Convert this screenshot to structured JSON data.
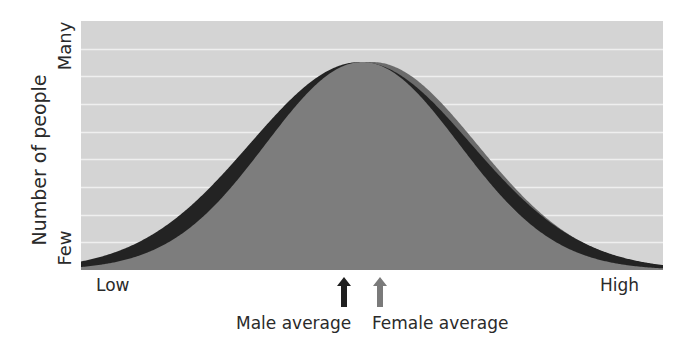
{
  "chart_data": {
    "type": "area",
    "title": "",
    "xlabel": "",
    "ylabel": "Number of people",
    "x_tick_labels": [
      "Low",
      "High"
    ],
    "y_tick_labels": [
      "Few",
      "Many"
    ],
    "grid": true,
    "gridlines_horizontal": 8,
    "legend": null,
    "series": [
      {
        "name": "Male",
        "shape": "normal distribution",
        "mean_relative": 0.48,
        "sd_relative": 0.19,
        "peak_relative": 1.0,
        "color": "#232323"
      },
      {
        "name": "Female",
        "shape": "normal distribution",
        "mean_relative": 0.5,
        "sd_relative": 0.18,
        "peak_relative": 1.0,
        "color_left_visible": "#7c7c7c",
        "color_right_tail": "#6a6a6a"
      }
    ],
    "annotations": [
      {
        "text": "Male average",
        "arrow": "up",
        "arrow_color": "#1e1e1e",
        "x_relative": 0.45
      },
      {
        "text": "Female average",
        "arrow": "up",
        "arrow_color": "#7a7a7a",
        "x_relative": 0.51
      }
    ]
  },
  "labels": {
    "y_axis_title": "Number of people",
    "y_top": "Many",
    "y_bottom": "Few",
    "x_left": "Low",
    "x_right": "High",
    "male_average": "Male average",
    "female_average": "Female average"
  },
  "colors": {
    "plot_background": "#d4d4d4",
    "gridline": "#efefef",
    "male_curve": "#232323",
    "female_curve": "#7d7d7d",
    "female_right_band": "#6b6b6b",
    "male_arrow": "#1f1f1f",
    "female_arrow": "#7a7a7a"
  }
}
